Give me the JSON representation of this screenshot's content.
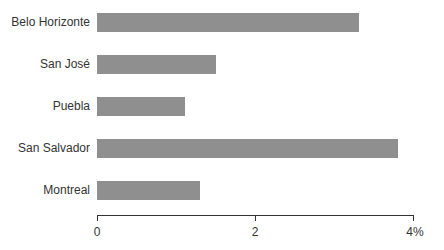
{
  "chart_data": {
    "type": "bar",
    "orientation": "horizontal",
    "title": "",
    "xlabel": "",
    "ylabel": "",
    "categories": [
      "Belo Horizonte",
      "San José",
      "Puebla",
      "San Salvador",
      "Montreal"
    ],
    "values": [
      3.32,
      1.51,
      1.11,
      3.81,
      1.3
    ],
    "xlim": [
      0,
      4
    ],
    "x_ticks": [
      "0",
      "2",
      "4%"
    ],
    "bar_color": "#8f8f8f",
    "grid": false,
    "legend": null
  }
}
